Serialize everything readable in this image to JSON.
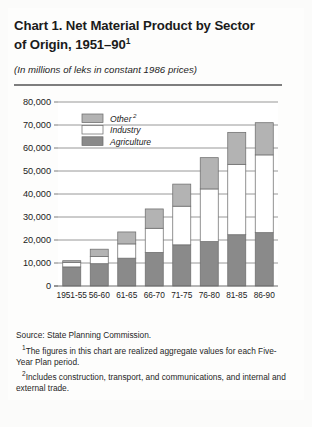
{
  "figure": {
    "title_line1": "Chart 1. Net Material Product by Sector",
    "title_line2": "of Origin, 1951–90",
    "title_footnote_marker": "1",
    "subtitle": "(In millions of leks in constant 1986 prices)",
    "source_label": "Source:  State Planning Commission.",
    "footnote1_marker": "1",
    "footnote1_text": "The figures in this chart are realized aggregate values for each Five-Year Plan period.",
    "footnote2_marker": "2",
    "footnote2_text": "Includes construction, transport, and communications, and internal and external trade."
  },
  "colors": {
    "other": "#b3b3b3",
    "industry": "#ffffff",
    "agriculture": "#8a8a8a",
    "axis": "#6e6e6e",
    "gridline": "#8d8d8d",
    "text": "#1b1b1b",
    "panel_background": "#fdfdfc"
  },
  "chart_data": {
    "type": "bar",
    "subtype": "stacked-vertical",
    "title": "Chart 1. Net Material Product by Sector of Origin, 1951–90",
    "subtitle": "(In millions of leks in constant 1986 prices)",
    "xlabel": "",
    "ylabel": "",
    "ylim": [
      0,
      80000
    ],
    "ytick_values": [
      0,
      10000,
      20000,
      30000,
      40000,
      50000,
      60000,
      70000,
      80000
    ],
    "ytick_labels": [
      "0",
      "10,000",
      "20,000",
      "30,000",
      "40,000",
      "50,000",
      "60,000",
      "70,000",
      "80,000"
    ],
    "grid": true,
    "grid_axis": "y",
    "legend_position": "upper-left-inside",
    "categories": [
      "1951-55",
      "56-60",
      "61-65",
      "66-70",
      "71-75",
      "76-80",
      "81-85",
      "86-90"
    ],
    "series": [
      {
        "name": "Agriculture",
        "color": "#8a8a8a",
        "values": [
          8300,
          9700,
          12100,
          14600,
          17900,
          19300,
          22300,
          23200
        ]
      },
      {
        "name": "Industry",
        "color": "#ffffff",
        "values": [
          2000,
          3100,
          6200,
          10500,
          16800,
          22900,
          30600,
          33800
        ]
      },
      {
        "name": "Other",
        "color": "#b3b3b3",
        "values": [
          700,
          3200,
          5200,
          8400,
          9600,
          13600,
          13900,
          14000
        ]
      }
    ],
    "totals": [
      11000,
      16000,
      23500,
      33500,
      44300,
      55800,
      66800,
      71000
    ],
    "legend_entries": [
      {
        "label": "Other",
        "marker": "2",
        "color": "#b3b3b3"
      },
      {
        "label": "Industry",
        "marker": "",
        "color": "#ffffff"
      },
      {
        "label": "Agriculture",
        "marker": "",
        "color": "#8a8a8a"
      }
    ]
  }
}
